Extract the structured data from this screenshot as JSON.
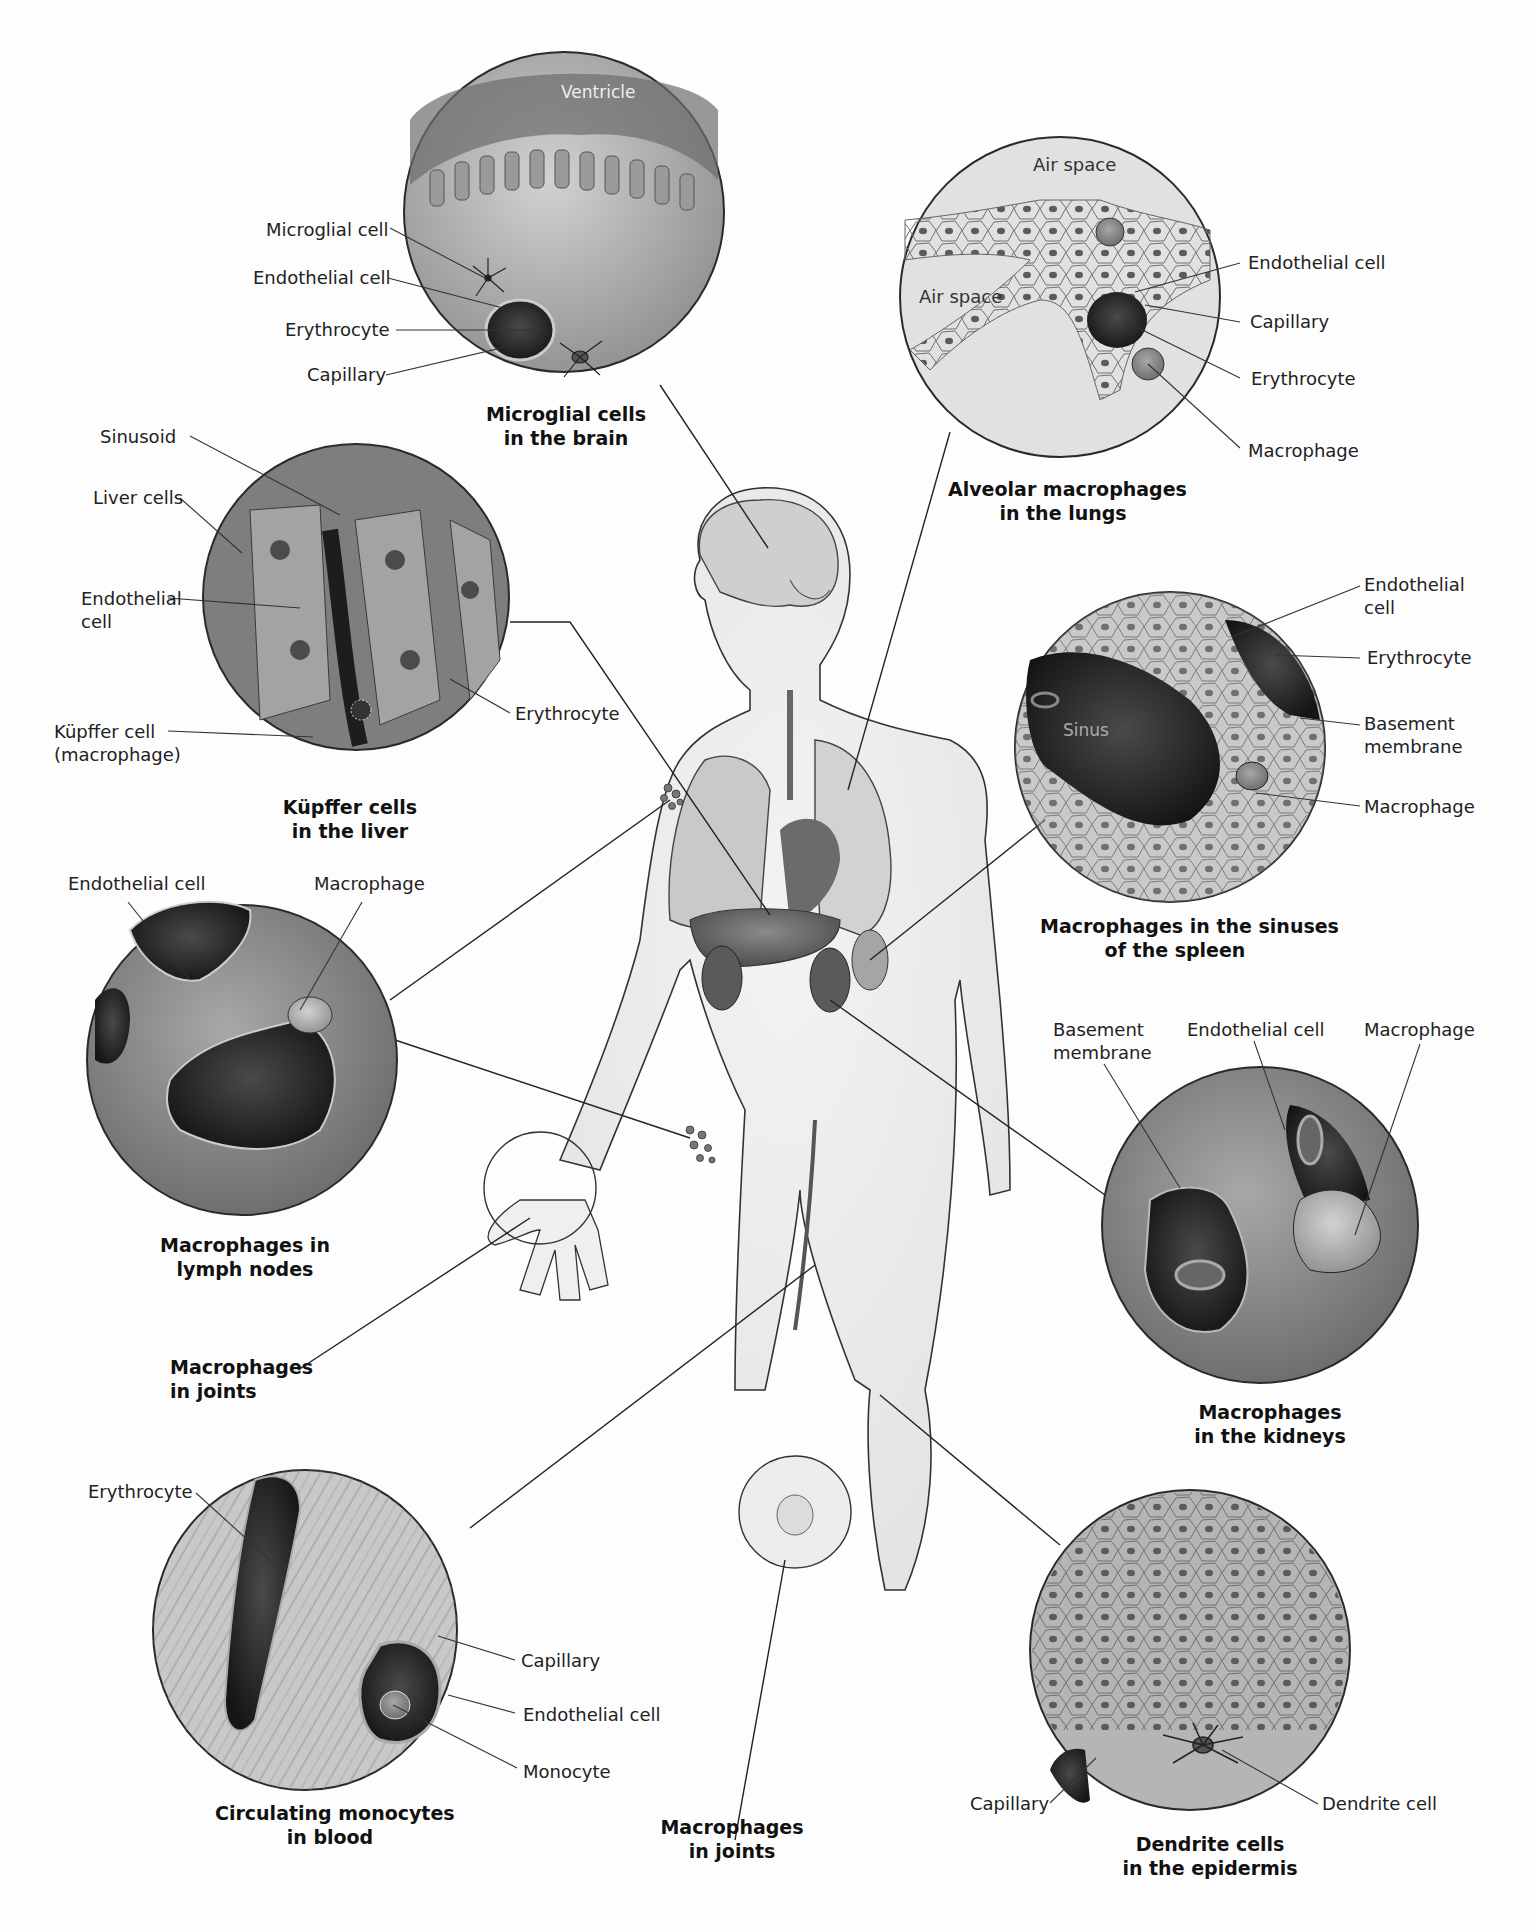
{
  "figure": {
    "colors": {
      "background": "#fdfdfd",
      "ink": "#1a1a1a",
      "tissue_light": "#b9b9b9",
      "tissue_dark": "#3a3a3a",
      "body_fill": "#f1f1f1"
    }
  },
  "insets": {
    "brain": {
      "caption": "Microglial cells\nin the brain",
      "inner_label": "Ventricle",
      "labels": [
        "Microglial cell",
        "Endothelial cell",
        "Erythrocyte",
        "Capillary"
      ]
    },
    "lungs": {
      "caption": "Alveolar macrophages\nin the lungs",
      "inner_labels": [
        "Air space",
        "Air space"
      ],
      "labels": [
        "Endothelial cell",
        "Capillary",
        "Erythrocyte",
        "Macrophage"
      ]
    },
    "liver": {
      "caption": "Küpffer cells\nin the liver",
      "labels": [
        "Sinusoid",
        "Liver cells",
        "Endothelial\ncell",
        "Küpffer cell\n(macrophage)",
        "Erythrocyte"
      ]
    },
    "spleen": {
      "caption": "Macrophages in the sinuses\nof the spleen",
      "inner_label": "Sinus",
      "labels": [
        "Endothelial\ncell",
        "Erythrocyte",
        "Basement\nmembrane",
        "Macrophage"
      ]
    },
    "lymph": {
      "caption": "Macrophages in\nlymph nodes",
      "labels": [
        "Endothelial cell",
        "Macrophage"
      ]
    },
    "kidneys": {
      "caption": "Macrophages\nin the kidneys",
      "labels": [
        "Basement\nmembrane",
        "Endothelial cell",
        "Macrophage"
      ]
    },
    "joints_wrist": {
      "caption": "Macrophages\nin joints"
    },
    "blood": {
      "caption": "Circulating monocytes\nin blood",
      "labels": [
        "Erythrocyte",
        "Capillary",
        "Endothelial cell",
        "Monocyte"
      ]
    },
    "joints_knee": {
      "caption": "Macrophages\nin joints"
    },
    "epidermis": {
      "caption": "Dendrite cells\nin the epidermis",
      "labels": [
        "Capillary",
        "Dendrite cell"
      ]
    }
  }
}
